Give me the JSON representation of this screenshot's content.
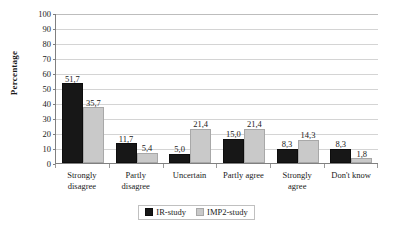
{
  "chart_data": {
    "type": "bar",
    "title": "",
    "subtitle": "",
    "xlabel": "",
    "ylabel": "Percentage",
    "ylim": [
      0,
      100
    ],
    "ytick_values": [
      100,
      90,
      80,
      70,
      60,
      50,
      40,
      30,
      20,
      10,
      0
    ],
    "ytick_labels": [
      "100",
      "90",
      "80",
      "70",
      "60",
      "50",
      "40",
      "30",
      "20",
      "10",
      "0"
    ],
    "grid": true,
    "grid_axis": "y",
    "legend_position": "bottom-center",
    "decimal_separator": ",",
    "categories": [
      "Strongly disagree",
      "Partly disagree",
      "Uncertain",
      "Partly agree",
      "Strongly agree",
      "Don't know"
    ],
    "category_lines": [
      [
        "Strongly",
        "disagree"
      ],
      [
        "Partly",
        "disagree"
      ],
      [
        "Uncertain",
        ""
      ],
      [
        "Partly agree",
        ""
      ],
      [
        "Strongly",
        "agree"
      ],
      [
        "Don't know",
        ""
      ]
    ],
    "series": [
      {
        "name": "IR-study",
        "color": "#171717",
        "values": [
          51.7,
          11.7,
          5.0,
          15.0,
          8.3,
          8.3
        ],
        "labels": [
          "51,7",
          "11,7",
          "5,0",
          "15,0",
          "8,3",
          "8,3"
        ]
      },
      {
        "name": "IMP2-study",
        "color": "#c9c9c9",
        "values": [
          35.7,
          5.4,
          21.4,
          21.4,
          14.3,
          1.8
        ],
        "labels": [
          "35,7",
          "5,4",
          "21,4",
          "21,4",
          "14,3",
          "1,8"
        ]
      }
    ]
  },
  "legend": {
    "items": [
      {
        "label": "IR-study"
      },
      {
        "label": "IMP2-study"
      }
    ]
  }
}
